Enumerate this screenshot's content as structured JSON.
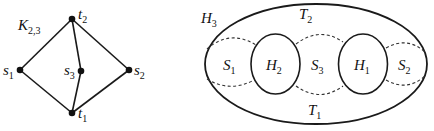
{
  "left_graph": {
    "title": "K",
    "title_sub": "2,3",
    "vertices": [
      {
        "id": "t2",
        "name": "t",
        "sub": "2",
        "x": 72,
        "y": 19
      },
      {
        "id": "s1",
        "name": "s",
        "sub": "1",
        "x": 20,
        "y": 70
      },
      {
        "id": "s3",
        "name": "s",
        "sub": "3",
        "x": 81,
        "y": 71
      },
      {
        "id": "s2",
        "name": "s",
        "sub": "2",
        "x": 129,
        "y": 70
      },
      {
        "id": "t1",
        "name": "t",
        "sub": "1",
        "x": 72,
        "y": 113
      }
    ],
    "edges": [
      [
        "s1",
        "t2"
      ],
      [
        "s1",
        "t1"
      ],
      [
        "s2",
        "t2"
      ],
      [
        "s2",
        "t1"
      ],
      [
        "s3",
        "t2"
      ],
      [
        "s3",
        "t1"
      ]
    ]
  },
  "right_diagram": {
    "outer": {
      "name": "H",
      "sub": "3"
    },
    "top": {
      "name": "T",
      "sub": "2"
    },
    "bottom": {
      "name": "T",
      "sub": "1"
    },
    "holes": [
      {
        "name": "H",
        "sub": "2"
      },
      {
        "name": "H",
        "sub": "1"
      }
    ],
    "regions": [
      {
        "name": "S",
        "sub": "1"
      },
      {
        "name": "S",
        "sub": "3"
      },
      {
        "name": "S",
        "sub": "2"
      }
    ]
  }
}
